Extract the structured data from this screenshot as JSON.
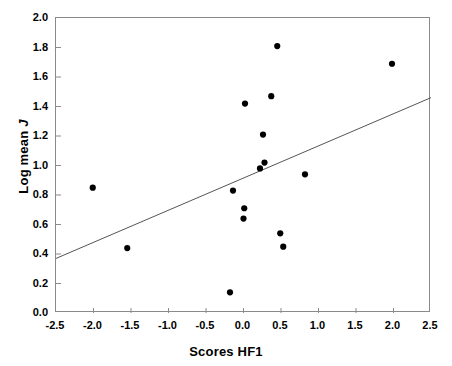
{
  "chart_data": {
    "type": "scatter",
    "title": "",
    "xlabel": "Scores HF1",
    "ylabel": "Log mean J",
    "ylabel_plain": "Log mean",
    "ylabel_italic": "J",
    "xlim": [
      -2.5,
      2.5
    ],
    "ylim": [
      0.0,
      2.0
    ],
    "xticks": [
      "-2.5",
      "-2.0",
      "-1.5",
      "-1.0",
      "-0.5",
      "0.0",
      "0.5",
      "1.0",
      "1.5",
      "2.0",
      "2.5"
    ],
    "xtick_values": [
      -2.5,
      -2.0,
      -1.5,
      -1.0,
      -0.5,
      0.0,
      0.5,
      1.0,
      1.5,
      2.0,
      2.5
    ],
    "yticks": [
      "0.0",
      "0.2",
      "0.4",
      "0.6",
      "0.8",
      "1.0",
      "1.2",
      "1.4",
      "1.6",
      "1.8",
      "2.0"
    ],
    "ytick_values": [
      0.0,
      0.2,
      0.4,
      0.6,
      0.8,
      1.0,
      1.2,
      1.4,
      1.6,
      1.8,
      2.0
    ],
    "grid": false,
    "legend": false,
    "marker": "filled-circle",
    "marker_color": "#000000",
    "marker_size": 5,
    "frame_color": "#8a8a8a",
    "points": [
      {
        "x": -2.01,
        "y": 0.85
      },
      {
        "x": -1.55,
        "y": 0.44
      },
      {
        "x": -0.18,
        "y": 0.14
      },
      {
        "x": -0.14,
        "y": 0.83
      },
      {
        "x": 0.0,
        "y": 0.64
      },
      {
        "x": 0.01,
        "y": 0.71
      },
      {
        "x": 0.02,
        "y": 1.42
      },
      {
        "x": 0.22,
        "y": 0.98
      },
      {
        "x": 0.26,
        "y": 1.21
      },
      {
        "x": 0.28,
        "y": 1.02
      },
      {
        "x": 0.37,
        "y": 1.47
      },
      {
        "x": 0.45,
        "y": 1.81
      },
      {
        "x": 0.49,
        "y": 0.54
      },
      {
        "x": 0.53,
        "y": 0.45
      },
      {
        "x": 0.82,
        "y": 0.94
      },
      {
        "x": 1.98,
        "y": 1.69
      }
    ],
    "trendline": {
      "type": "linear-fit",
      "color": "#555555",
      "x_start": -2.5,
      "y_start": 0.37,
      "x_end": 2.5,
      "y_end": 1.46
    }
  }
}
